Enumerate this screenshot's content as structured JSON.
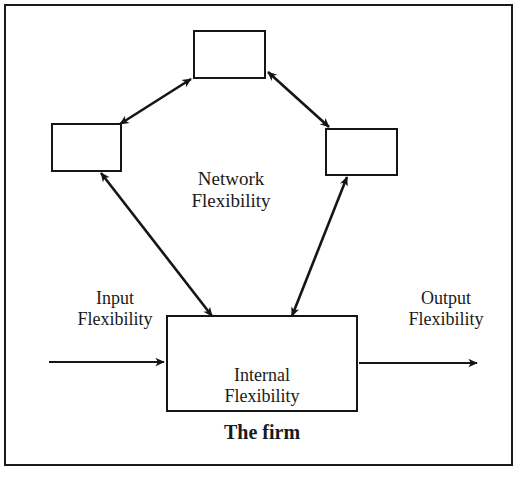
{
  "figure": {
    "kind": "conceptual-diagram",
    "background_color": "#ffffff",
    "line_color": "#151515",
    "border_color": "#1a1a1a"
  },
  "nodes": [
    {
      "id": "top",
      "label": "",
      "shape": "rectangle",
      "x": 193,
      "y": 30,
      "w": 73,
      "h": 49
    },
    {
      "id": "left",
      "label": "",
      "shape": "rectangle",
      "x": 51,
      "y": 123,
      "w": 71,
      "h": 49
    },
    {
      "id": "right",
      "label": "",
      "shape": "rectangle",
      "x": 325,
      "y": 128,
      "w": 73,
      "h": 48
    },
    {
      "id": "firm",
      "label": "",
      "shape": "rectangle",
      "x": 166,
      "y": 315,
      "w": 192,
      "h": 97
    }
  ],
  "labels": {
    "network_flexibility": "Network\nFlexibility",
    "input_flexibility": "Input\nFlexibility",
    "output_flexibility": "Output\nFlexibility",
    "internal_flexibility": "Internal\nFlexibility",
    "the_firm": "The firm"
  },
  "connectors": [
    {
      "name": "left-to-top",
      "from": "left",
      "to": "top",
      "arrowheads": "both"
    },
    {
      "name": "top-to-right",
      "from": "top",
      "to": "right",
      "arrowheads": "both"
    },
    {
      "name": "left-to-firm",
      "from": "left",
      "to": "firm",
      "arrowheads": "both"
    },
    {
      "name": "right-to-firm",
      "from": "right",
      "to": "firm",
      "arrowheads": "both"
    },
    {
      "name": "input-flow",
      "from": "outside-left",
      "to": "firm",
      "arrowheads": "end"
    },
    {
      "name": "output-flow",
      "from": "firm",
      "to": "outside-right",
      "arrowheads": "end"
    },
    {
      "name": "internal-loop",
      "from": "firm",
      "to": "firm",
      "arrowheads": "end"
    }
  ]
}
